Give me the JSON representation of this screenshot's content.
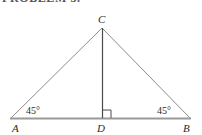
{
  "header": {
    "cropped_text": "PROBLEM 3."
  },
  "figure": {
    "background_color": "#ffffff",
    "stroke_color": "#8c8c8c",
    "baseline_color": "#9a9a9a",
    "altitude_color": "#4a4a4a",
    "label_color": "#2b2b2b",
    "vertices": {
      "A": {
        "label": "A",
        "x": 11,
        "y": 118,
        "label_x": 13,
        "label_y": 131
      },
      "B": {
        "label": "B",
        "x": 190,
        "y": 118,
        "label_x": 184,
        "label_y": 131
      },
      "C": {
        "label": "C",
        "x": 102,
        "y": 28,
        "label_x": 98,
        "label_y": 23
      },
      "D": {
        "label": "D",
        "x": 102,
        "y": 118,
        "label_x": 98,
        "label_y": 131
      }
    },
    "angles": {
      "at_A": {
        "label": "45°",
        "value": 45,
        "unit": "degrees",
        "label_x": 27,
        "label_y": 113
      },
      "at_B": {
        "label": "45°",
        "value": 45,
        "unit": "degrees",
        "label_x": 158,
        "label_y": 113
      },
      "at_D": {
        "label": "right-angle-mark",
        "value": 90,
        "unit": "degrees"
      }
    },
    "segments": [
      {
        "name": "side-AC",
        "from": "A",
        "to": "C"
      },
      {
        "name": "side-CB",
        "from": "C",
        "to": "B"
      },
      {
        "name": "base-AB",
        "from": "A",
        "to": "B"
      },
      {
        "name": "altitude-CD",
        "from": "C",
        "to": "D"
      }
    ],
    "right_angle_mark": {
      "x": 103,
      "y": 109,
      "size": 8
    }
  }
}
